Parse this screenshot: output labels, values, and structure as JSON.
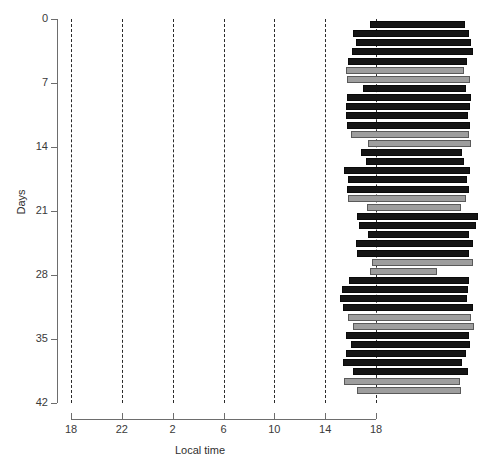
{
  "chart_data": {
    "type": "bar",
    "title": "",
    "xlabel": "Local time",
    "ylabel": "Days",
    "xlim": [
      18,
      42
    ],
    "ylim": [
      0,
      42
    ],
    "x_tick_labels": [
      "18",
      "22",
      "2",
      "6",
      "10",
      "14",
      "18"
    ],
    "x_tick_hours": [
      18,
      22,
      26,
      30,
      34,
      38,
      42
    ],
    "y_tick_labels": [
      "0",
      "7",
      "14",
      "21",
      "28",
      "35",
      "42"
    ],
    "y_tick_values": [
      0,
      7,
      14,
      21,
      28,
      35,
      42
    ],
    "grid": "vertical dashed gridlines every 4 hours",
    "legend": null,
    "series_colors": {
      "active": "#151515",
      "rest": "#9e9e9e"
    },
    "bars": [
      {
        "day": 0,
        "start": 41.5,
        "end": 49.0,
        "type": "active"
      },
      {
        "day": 1,
        "start": 40.2,
        "end": 49.3,
        "type": "active"
      },
      {
        "day": 2,
        "start": 40.4,
        "end": 49.5,
        "type": "active"
      },
      {
        "day": 3,
        "start": 40.1,
        "end": 49.6,
        "type": "active"
      },
      {
        "day": 4,
        "start": 39.8,
        "end": 49.2,
        "type": "active"
      },
      {
        "day": 5,
        "start": 39.6,
        "end": 48.9,
        "type": "rest"
      },
      {
        "day": 6,
        "start": 39.7,
        "end": 49.4,
        "type": "rest"
      },
      {
        "day": 7,
        "start": 41.0,
        "end": 49.1,
        "type": "active"
      },
      {
        "day": 8,
        "start": 39.7,
        "end": 49.5,
        "type": "active"
      },
      {
        "day": 9,
        "start": 39.6,
        "end": 49.4,
        "type": "active"
      },
      {
        "day": 10,
        "start": 39.6,
        "end": 49.2,
        "type": "active"
      },
      {
        "day": 11,
        "start": 39.7,
        "end": 49.4,
        "type": "active"
      },
      {
        "day": 12,
        "start": 40.0,
        "end": 49.3,
        "type": "rest"
      },
      {
        "day": 13,
        "start": 41.4,
        "end": 49.5,
        "type": "rest"
      },
      {
        "day": 14,
        "start": 40.8,
        "end": 48.8,
        "type": "active"
      },
      {
        "day": 15,
        "start": 41.2,
        "end": 48.9,
        "type": "active"
      },
      {
        "day": 16,
        "start": 39.5,
        "end": 49.4,
        "type": "active"
      },
      {
        "day": 17,
        "start": 39.8,
        "end": 49.2,
        "type": "active"
      },
      {
        "day": 18,
        "start": 39.7,
        "end": 49.3,
        "type": "active"
      },
      {
        "day": 19,
        "start": 39.8,
        "end": 49.1,
        "type": "rest"
      },
      {
        "day": 20,
        "start": 41.3,
        "end": 48.7,
        "type": "rest"
      },
      {
        "day": 21,
        "start": 40.5,
        "end": 50.0,
        "type": "active"
      },
      {
        "day": 22,
        "start": 40.7,
        "end": 49.9,
        "type": "active"
      },
      {
        "day": 23,
        "start": 41.4,
        "end": 49.3,
        "type": "active"
      },
      {
        "day": 24,
        "start": 40.4,
        "end": 49.6,
        "type": "active"
      },
      {
        "day": 25,
        "start": 40.5,
        "end": 49.3,
        "type": "active"
      },
      {
        "day": 26,
        "start": 41.7,
        "end": 49.6,
        "type": "rest"
      },
      {
        "day": 27,
        "start": 41.5,
        "end": 46.8,
        "type": "rest"
      },
      {
        "day": 28,
        "start": 39.9,
        "end": 49.3,
        "type": "active"
      },
      {
        "day": 29,
        "start": 39.3,
        "end": 49.2,
        "type": "active"
      },
      {
        "day": 30,
        "start": 39.2,
        "end": 49.2,
        "type": "active"
      },
      {
        "day": 31,
        "start": 39.4,
        "end": 49.6,
        "type": "active"
      },
      {
        "day": 32,
        "start": 39.8,
        "end": 49.5,
        "type": "rest"
      },
      {
        "day": 33,
        "start": 40.2,
        "end": 49.7,
        "type": "rest"
      },
      {
        "day": 34,
        "start": 39.6,
        "end": 49.3,
        "type": "active"
      },
      {
        "day": 35,
        "start": 40.0,
        "end": 49.4,
        "type": "active"
      },
      {
        "day": 36,
        "start": 39.6,
        "end": 49.1,
        "type": "active"
      },
      {
        "day": 37,
        "start": 39.4,
        "end": 48.8,
        "type": "active"
      },
      {
        "day": 38,
        "start": 40.2,
        "end": 49.2,
        "type": "active"
      },
      {
        "day": 39,
        "start": 39.5,
        "end": 48.6,
        "type": "rest"
      },
      {
        "day": 40,
        "start": 40.5,
        "end": 48.7,
        "type": "rest"
      }
    ]
  },
  "axes": {
    "x_title": "Local time",
    "y_title": "Days"
  },
  "caption": ""
}
